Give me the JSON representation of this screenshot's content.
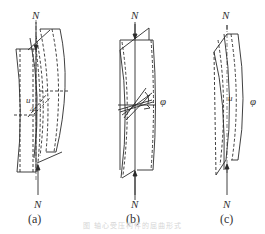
{
  "figure": {
    "panels": [
      {
        "id": "a",
        "label": "(a)",
        "top_force": "N",
        "bottom_force": "N",
        "displacement_symbol": "u",
        "increment_symbol": "ΔL",
        "mode": "flexural buckling"
      },
      {
        "id": "b",
        "label": "(b)",
        "top_force": "N",
        "bottom_force": "N",
        "rotation_symbol": "φ",
        "mode": "torsional buckling"
      },
      {
        "id": "c",
        "label": "(c)",
        "top_force": "N",
        "bottom_force": "N",
        "displacement_symbol": "u",
        "rotation_symbol": "φ",
        "mode": "flexural-torsional buckling"
      }
    ],
    "caption": "图  轴心受压构件的屈曲形式",
    "colors": {
      "line": "#2a2a2a",
      "caption": "#d6d6d6"
    }
  }
}
